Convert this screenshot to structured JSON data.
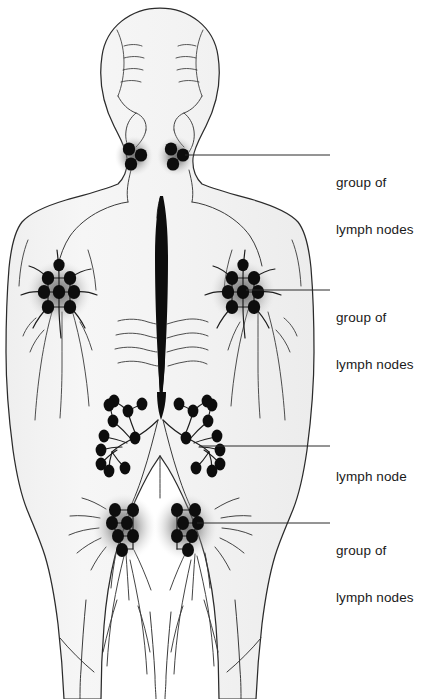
{
  "figure": {
    "view": "posterior (back) view of a human figure",
    "background_color": "#ffffff",
    "body_fill_color": "#f4f4f4",
    "outline_color": "#2b2b2b",
    "node_color": "#0d0d0d",
    "halo_color": "#6e6e6e",
    "text_color": "#1a1a1a"
  },
  "labels": {
    "cervical": {
      "line1": "group of",
      "line2": "lymph nodes",
      "region": "cervical-lymph-nodes",
      "leader_from_x": 185,
      "leader_from_y": 155,
      "leader_to_x": 330,
      "leader_to_y": 155
    },
    "axillary": {
      "line1": "group of",
      "line2": "lymph nodes",
      "region": "axillary-lymph-nodes",
      "leader_from_x": 246,
      "leader_from_y": 290,
      "leader_to_x": 330,
      "leader_to_y": 290
    },
    "single_node": {
      "line1": "lymph node",
      "region": "iliac-lymph-node",
      "leader_from_x": 199,
      "leader_from_y": 446,
      "leader_to_x": 330,
      "leader_to_y": 446
    },
    "inguinal": {
      "line1": "group of",
      "line2": "lymph nodes",
      "region": "inguinal-lymph-nodes",
      "leader_from_x": 197,
      "leader_from_y": 523,
      "leader_to_x": 330,
      "leader_to_y": 523
    }
  },
  "anatomy": {
    "thoracic_duct": "central vertical black duct along the spine",
    "node_groups": [
      {
        "name": "cervical-left",
        "count": 3,
        "center_x": 134,
        "center_y": 156,
        "halo_rx": 19,
        "halo_ry": 20
      },
      {
        "name": "cervical-right",
        "count": 3,
        "center_x": 176,
        "center_y": 156,
        "halo_rx": 19,
        "halo_ry": 20
      },
      {
        "name": "axillary-left",
        "count": 8,
        "center_x": 59,
        "center_y": 292,
        "halo_rx": 32,
        "halo_ry": 31
      },
      {
        "name": "axillary-right",
        "count": 8,
        "center_x": 243,
        "center_y": 292,
        "halo_rx": 32,
        "halo_ry": 31
      },
      {
        "name": "inguinal-left",
        "count": 7,
        "center_x": 124,
        "center_y": 527,
        "halo_rx": 31,
        "halo_ry": 33
      },
      {
        "name": "inguinal-right",
        "count": 7,
        "center_x": 186,
        "center_y": 527,
        "halo_rx": 31,
        "halo_ry": 33
      }
    ],
    "individual_node_chains": [
      {
        "name": "iliac-left",
        "count": 11,
        "center_x": 127,
        "center_y": 434
      },
      {
        "name": "iliac-right",
        "count": 11,
        "center_x": 184,
        "center_y": 434
      }
    ]
  }
}
